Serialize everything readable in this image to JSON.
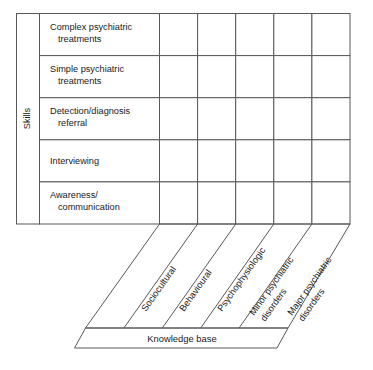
{
  "figure": {
    "type": "matrix-diagram",
    "axes": {
      "vertical_axis_title": "Skills",
      "horizontal_axis_title": "Knowledge base"
    },
    "rows": [
      {
        "line1": "Complex psychiatric",
        "line2": "treatments"
      },
      {
        "line1": "Simple psychiatric",
        "line2": "treatments"
      },
      {
        "line1": "Detection/diagnosis",
        "line2": "referral"
      },
      {
        "line1": "Interviewing",
        "line2": ""
      },
      {
        "line1": "Awareness/",
        "line2": "communication"
      }
    ],
    "columns": [
      {
        "line1": "Sociocultural",
        "line2": ""
      },
      {
        "line1": "Behavioural",
        "line2": ""
      },
      {
        "line1": "Psychophysiologic",
        "line2": ""
      },
      {
        "line1": "Minor psychiatric",
        "line2": "disorders"
      },
      {
        "line1": "Major psychiatric",
        "line2": "disorders"
      }
    ],
    "grid": {
      "row_count": 5,
      "column_count": 5,
      "cells_empty": true
    },
    "colors": {
      "stroke": "#58585a",
      "text": "#1a1a1a",
      "background": "#ffffff"
    }
  }
}
